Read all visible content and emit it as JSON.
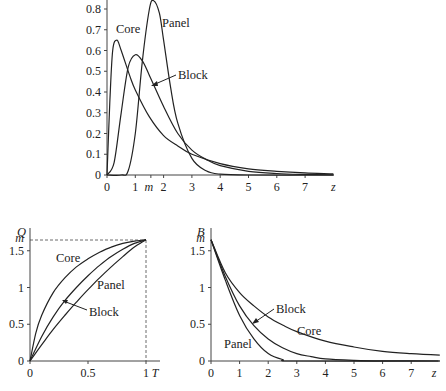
{
  "chart_data": [
    {
      "type": "line",
      "title": "",
      "xlabel": "z",
      "ylabel": "",
      "xlim": [
        0,
        8
      ],
      "ylim": [
        0,
        0.85
      ],
      "x_ticks": [
        "0",
        "1",
        "m",
        "2",
        "3",
        "4",
        "5",
        "6",
        "7",
        "z"
      ],
      "y_ticks": [
        "0",
        "0.1",
        "0.2",
        "0.3",
        "0.4",
        "0.5",
        "0.6",
        "0.7",
        "0.8"
      ],
      "series": [
        {
          "name": "Core",
          "x": [
            0,
            0.1,
            0.2,
            0.35,
            0.5,
            0.8,
            1,
            1.5,
            2,
            2.5,
            3,
            4,
            5,
            6,
            7,
            8
          ],
          "values": [
            0,
            0.35,
            0.6,
            0.65,
            0.6,
            0.48,
            0.41,
            0.28,
            0.19,
            0.14,
            0.1,
            0.055,
            0.03,
            0.018,
            0.01,
            0.006
          ]
        },
        {
          "name": "Block",
          "x": [
            0,
            0.25,
            0.5,
            0.75,
            1,
            1.25,
            1.5,
            2,
            2.5,
            3,
            3.5,
            4,
            5,
            6,
            7,
            8
          ],
          "values": [
            0,
            0.06,
            0.3,
            0.52,
            0.58,
            0.55,
            0.48,
            0.33,
            0.2,
            0.12,
            0.075,
            0.045,
            0.018,
            0.007,
            0.003,
            0.001
          ]
        },
        {
          "name": "Panel",
          "x": [
            0,
            0.5,
            0.75,
            1,
            1.25,
            1.5,
            1.65,
            1.85,
            2,
            2.25,
            2.5,
            3,
            3.5,
            4,
            5,
            8
          ],
          "values": [
            0,
            0,
            0.02,
            0.2,
            0.55,
            0.8,
            0.84,
            0.78,
            0.65,
            0.42,
            0.25,
            0.08,
            0.02,
            0.004,
            0,
            0
          ]
        }
      ],
      "annotations": [
        "Core",
        "Panel",
        "Block"
      ]
    },
    {
      "type": "line",
      "title": "",
      "xlabel": "T",
      "ylabel": "Q",
      "xlim": [
        0,
        1
      ],
      "ylim": [
        0,
        1.65
      ],
      "x_ticks": [
        "0",
        "0.5",
        "1"
      ],
      "y_ticks": [
        "0",
        "0.5",
        "1",
        "1.5",
        "m"
      ],
      "series": [
        {
          "name": "Core",
          "x": [
            0,
            0.05,
            0.1,
            0.2,
            0.3,
            0.4,
            0.5,
            0.6,
            0.7,
            0.8,
            0.9,
            1
          ],
          "values": [
            0,
            0.38,
            0.62,
            0.93,
            1.13,
            1.28,
            1.39,
            1.48,
            1.55,
            1.6,
            1.63,
            1.65
          ]
        },
        {
          "name": "Block",
          "x": [
            0,
            0.1,
            0.2,
            0.3,
            0.4,
            0.5,
            0.6,
            0.7,
            0.8,
            0.9,
            1
          ],
          "values": [
            0,
            0.33,
            0.6,
            0.82,
            1.0,
            1.16,
            1.3,
            1.42,
            1.52,
            1.6,
            1.65
          ]
        },
        {
          "name": "Panel",
          "x": [
            0,
            0.1,
            0.2,
            0.3,
            0.4,
            0.5,
            0.6,
            0.7,
            0.8,
            0.9,
            1
          ],
          "values": [
            0,
            0.22,
            0.43,
            0.62,
            0.8,
            0.97,
            1.13,
            1.28,
            1.42,
            1.55,
            1.65
          ]
        }
      ],
      "reference_lines": {
        "horizontal": "m",
        "vertical": 1
      },
      "annotations": [
        "Core",
        "Panel",
        "Block"
      ]
    },
    {
      "type": "line",
      "title": "",
      "xlabel": "z",
      "ylabel": "B",
      "xlim": [
        0,
        8
      ],
      "ylim": [
        0,
        1.65
      ],
      "x_ticks": [
        "0",
        "1",
        "2",
        "3",
        "4",
        "5",
        "6",
        "7",
        "z"
      ],
      "y_ticks": [
        "0",
        "0.5",
        "1",
        "1.5",
        "m"
      ],
      "series": [
        {
          "name": "Core",
          "x": [
            0,
            0.5,
            1,
            1.5,
            2,
            2.5,
            3,
            4,
            5,
            6,
            7,
            8
          ],
          "values": [
            1.65,
            1.2,
            0.93,
            0.75,
            0.6,
            0.49,
            0.4,
            0.27,
            0.19,
            0.13,
            0.1,
            0.08
          ]
        },
        {
          "name": "Block",
          "x": [
            0,
            0.5,
            1,
            1.5,
            2,
            2.5,
            3,
            3.5,
            4,
            5,
            6,
            8
          ],
          "values": [
            1.65,
            1.15,
            0.75,
            0.48,
            0.3,
            0.18,
            0.1,
            0.06,
            0.03,
            0.01,
            0.003,
            0
          ]
        },
        {
          "name": "Panel",
          "x": [
            0,
            0.5,
            1,
            1.5,
            2,
            2.5,
            3,
            8
          ],
          "values": [
            1.65,
            1.1,
            0.62,
            0.3,
            0.1,
            0.02,
            0,
            0
          ]
        }
      ],
      "annotations": [
        "Block",
        "Core",
        "Panel"
      ]
    }
  ],
  "labels": {
    "top": {
      "core": "Core",
      "panel": "Panel",
      "block": "Block",
      "x_axis": "z",
      "m": "m"
    },
    "left": {
      "y_axis": "Q",
      "x_axis": "T",
      "core": "Core",
      "panel": "Panel",
      "block": "Block",
      "m": "m"
    },
    "right": {
      "y_axis": "B",
      "x_axis": "z",
      "core": "Core",
      "panel": "Panel",
      "block": "Block",
      "m": "m"
    }
  }
}
